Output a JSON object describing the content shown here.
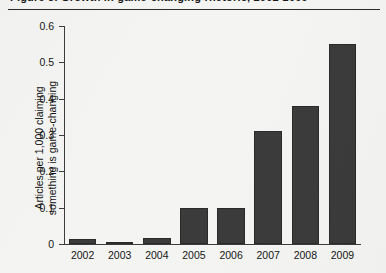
{
  "header": {
    "clipped_title": "Figure 3. Growth in game-changing rhetoric, 2002-2009",
    "rule_color": "#2b2b2b"
  },
  "colors": {
    "bar_fill": "#3b3b3b",
    "bar_edge": "#2a2a2a",
    "axis": "#3c3c3c",
    "background": "#f4f4f2",
    "text": "#141414"
  },
  "chart_data": {
    "type": "bar",
    "title": "",
    "xlabel": "",
    "ylabel_line1": "Articles per 1,000 claiming",
    "ylabel_line2": "something is game-changing",
    "categories": [
      "2002",
      "2003",
      "2004",
      "2005",
      "2006",
      "2007",
      "2008",
      "2009"
    ],
    "values": [
      0.015,
      0.005,
      0.017,
      0.1,
      0.1,
      0.31,
      0.38,
      0.55
    ],
    "ylim": [
      0,
      0.6
    ],
    "yticks": [
      0,
      0.1,
      0.2,
      0.3,
      0.4,
      0.5,
      0.6
    ],
    "ytick_labels": [
      "0",
      "0.1",
      "0.2",
      "0.3",
      "0.4",
      "0.5",
      "0.6"
    ],
    "grid": false,
    "legend": false,
    "legend_position": "none"
  }
}
